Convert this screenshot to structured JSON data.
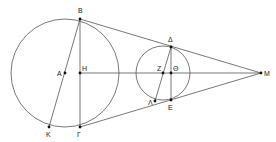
{
  "diagram": {
    "stroke_color": "#555555",
    "point_color": "#111111",
    "circles": [
      {
        "name": "large-circle",
        "cx": 65,
        "cy": 73,
        "r": 54
      },
      {
        "name": "small-circle",
        "cx": 163,
        "cy": 73,
        "r": 27
      }
    ],
    "points": {
      "B": {
        "label": "Β",
        "x": 80,
        "y": 19,
        "lx": 78,
        "ly": 13
      },
      "A": {
        "label": "Α",
        "x": 65,
        "y": 73,
        "lx": 57,
        "ly": 76
      },
      "H": {
        "label": "Η",
        "x": 80,
        "y": 73,
        "lx": 82,
        "ly": 71
      },
      "K": {
        "label": "Κ",
        "x": 49,
        "y": 127,
        "lx": 46,
        "ly": 137
      },
      "Gamma": {
        "label": "Γ",
        "x": 80,
        "y": 127,
        "lx": 77,
        "ly": 137
      },
      "Delta": {
        "label": "Δ",
        "x": 171,
        "y": 47,
        "lx": 168,
        "ly": 42
      },
      "Z": {
        "label": "Ζ",
        "x": 163,
        "y": 73,
        "lx": 157,
        "ly": 71
      },
      "Theta": {
        "label": "Θ",
        "x": 171,
        "y": 73,
        "lx": 173,
        "ly": 71
      },
      "Lambda": {
        "label": "Λ",
        "x": 155,
        "y": 101,
        "lx": 148,
        "ly": 105
      },
      "E": {
        "label": "Ε",
        "x": 171,
        "y": 100,
        "lx": 168,
        "ly": 110
      },
      "M": {
        "label": "Μ",
        "x": 261,
        "y": 73,
        "lx": 264,
        "ly": 76
      }
    },
    "segments": [
      [
        "B",
        "M"
      ],
      [
        "Gamma",
        "M"
      ],
      [
        "B",
        "Gamma"
      ],
      [
        "B",
        "K"
      ],
      [
        "H",
        "M"
      ],
      [
        "Delta",
        "E"
      ],
      [
        "Delta",
        "Lambda"
      ]
    ]
  }
}
